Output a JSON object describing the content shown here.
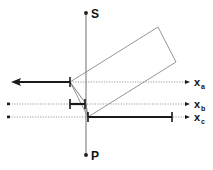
{
  "figure": {
    "title": "",
    "width": 213,
    "height": 170,
    "background": "#ffffff"
  },
  "colors": {
    "stroke_dark": "#1a1a1a",
    "stroke_thin": "#7b7b7b",
    "dotted_guide": "#9a9a9a",
    "rectangle_outline": "#8a8a8a"
  },
  "poles": {
    "top": {
      "label": "S",
      "marker": "dot-marker",
      "x": 86,
      "y": 13
    },
    "bottom": {
      "label": "P",
      "marker": "dot-marker",
      "x": 86,
      "y": 155
    }
  },
  "vertical_axis": {
    "name": "S-P axis",
    "x": 86,
    "y_top": 14,
    "y_bottom": 154
  },
  "axes": [
    {
      "id": "xa",
      "label": "x",
      "subscript": "a",
      "y": 82,
      "dotted_from": 70,
      "dotted_to": 188,
      "arrow_head": "right",
      "label_x": 194,
      "label_y": 86
    },
    {
      "id": "xb",
      "label": "x",
      "subscript": "b",
      "y": 104,
      "dotted_from": 8,
      "dotted_to": 188,
      "arrow_head": "right",
      "label_x": 194,
      "label_y": 108
    },
    {
      "id": "xc",
      "label": "x",
      "subscript": "c",
      "y": 117,
      "dotted_from": 8,
      "dotted_to": 188,
      "arrow_head": "right",
      "label_x": 194,
      "label_y": 121
    }
  ],
  "segments": [
    {
      "id": "segment-a",
      "on_axis": "xa",
      "y": 82,
      "x_start": 70,
      "x_end": 13,
      "end_style": "arrow-left",
      "start_style": "tick",
      "weight": 2.2
    },
    {
      "id": "segment-b",
      "on_axis": "xb",
      "y": 104,
      "x_start": 70,
      "x_end": 85,
      "end_style": "tick",
      "start_style": "tick",
      "weight": 2.2
    },
    {
      "id": "segment-c",
      "on_axis": "xc",
      "y": 117,
      "x_start": 88,
      "x_end": 172,
      "end_style": "tick",
      "start_style": "tick",
      "weight": 2.2
    }
  ],
  "guide_dots": [
    {
      "id": "guide-dot-b",
      "x": 9,
      "y": 104
    },
    {
      "id": "guide-dot-c",
      "x": 9,
      "y": 117
    }
  ],
  "rectangle": {
    "id": "tilted-rectangle",
    "corners": [
      {
        "x": 70,
        "y": 82
      },
      {
        "x": 158,
        "y": 27
      },
      {
        "x": 176,
        "y": 62
      },
      {
        "x": 88,
        "y": 117
      }
    ]
  },
  "connector_lines": [
    {
      "id": "connector-a-to-origin",
      "x1": 70,
      "y1": 82,
      "x2": 86,
      "y2": 104
    },
    {
      "id": "connector-origin-to-c",
      "x1": 86,
      "y1": 104,
      "x2": 88,
      "y2": 117
    }
  ]
}
